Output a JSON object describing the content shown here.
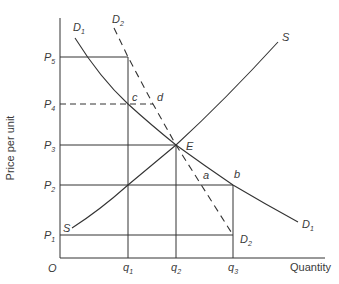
{
  "diagram": {
    "type": "supply-demand",
    "y_axis_label": "Price per unit",
    "x_axis_label": "Quantity",
    "origin_label": "O",
    "price_levels": [
      {
        "label": "P",
        "sub": "5",
        "y": 57
      },
      {
        "label": "P",
        "sub": "4",
        "y": 104
      },
      {
        "label": "P",
        "sub": "3",
        "y": 145
      },
      {
        "label": "P",
        "sub": "2",
        "y": 185
      },
      {
        "label": "P",
        "sub": "1",
        "y": 235
      }
    ],
    "quantity_levels": [
      {
        "label": "q",
        "sub": "1",
        "x": 128
      },
      {
        "label": "q",
        "sub": "2",
        "x": 176
      },
      {
        "label": "q",
        "sub": "3",
        "x": 233
      }
    ],
    "curves": {
      "D1": {
        "label": "D",
        "sub": "1",
        "style": "solid"
      },
      "D2": {
        "label": "D",
        "sub": "2",
        "style": "dashed"
      },
      "S": {
        "label": "S",
        "style": "solid"
      }
    },
    "points": {
      "E": "E",
      "a": "a",
      "b": "b",
      "c": "c",
      "d": "d"
    },
    "line_color": "#333333"
  }
}
